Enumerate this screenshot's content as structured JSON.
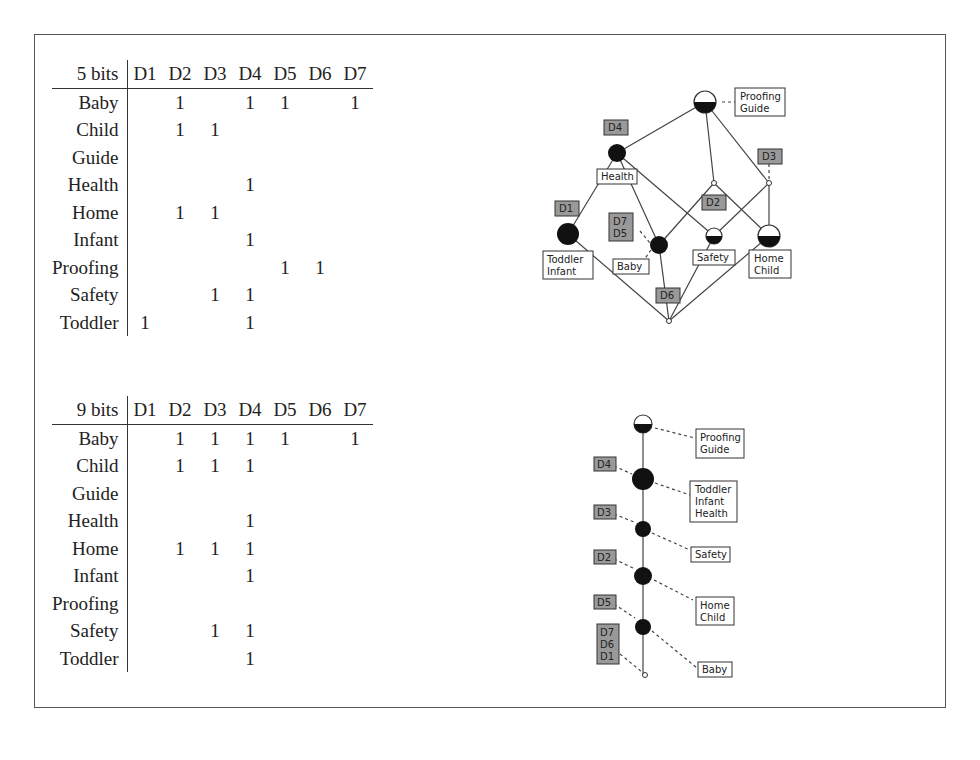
{
  "figure": {
    "tables": [
      {
        "title": "5 bits",
        "columns": [
          "D1",
          "D2",
          "D3",
          "D4",
          "D5",
          "D6",
          "D7"
        ],
        "rows": [
          {
            "label": "Baby",
            "cells": [
              "",
              "1",
              "",
              "1",
              "1",
              "",
              "1"
            ]
          },
          {
            "label": "Child",
            "cells": [
              "",
              "1",
              "1",
              "",
              "",
              "",
              ""
            ]
          },
          {
            "label": "Guide",
            "cells": [
              "",
              "",
              "",
              "",
              "",
              "",
              ""
            ]
          },
          {
            "label": "Health",
            "cells": [
              "",
              "",
              "",
              "1",
              "",
              "",
              ""
            ]
          },
          {
            "label": "Home",
            "cells": [
              "",
              "1",
              "1",
              "",
              "",
              "",
              ""
            ]
          },
          {
            "label": "Infant",
            "cells": [
              "",
              "",
              "",
              "1",
              "",
              "",
              ""
            ]
          },
          {
            "label": "Proofing",
            "cells": [
              "",
              "",
              "",
              "",
              "1",
              "1",
              ""
            ]
          },
          {
            "label": "Safety",
            "cells": [
              "",
              "",
              "1",
              "1",
              "",
              "",
              ""
            ]
          },
          {
            "label": "Toddler",
            "cells": [
              "1",
              "",
              "",
              "1",
              "",
              "",
              ""
            ]
          }
        ]
      },
      {
        "title": "9 bits",
        "columns": [
          "D1",
          "D2",
          "D3",
          "D4",
          "D5",
          "D6",
          "D7"
        ],
        "rows": [
          {
            "label": "Baby",
            "cells": [
              "",
              "1",
              "1",
              "1",
              "1",
              "",
              "1"
            ]
          },
          {
            "label": "Child",
            "cells": [
              "",
              "1",
              "1",
              "1",
              "",
              "",
              ""
            ]
          },
          {
            "label": "Guide",
            "cells": [
              "",
              "",
              "",
              "",
              "",
              "",
              ""
            ]
          },
          {
            "label": "Health",
            "cells": [
              "",
              "",
              "",
              "1",
              "",
              "",
              ""
            ]
          },
          {
            "label": "Home",
            "cells": [
              "",
              "1",
              "1",
              "1",
              "",
              "",
              ""
            ]
          },
          {
            "label": "Infant",
            "cells": [
              "",
              "",
              "",
              "1",
              "",
              "",
              ""
            ]
          },
          {
            "label": "Proofing",
            "cells": [
              "",
              "",
              "",
              "",
              "",
              "",
              ""
            ]
          },
          {
            "label": "Safety",
            "cells": [
              "",
              "",
              "1",
              "1",
              "",
              "",
              ""
            ]
          },
          {
            "label": "Toddler",
            "cells": [
              "",
              "",
              "",
              "1",
              "",
              "",
              ""
            ]
          }
        ]
      }
    ],
    "lattice5": {
      "object_labels": {
        "top": [
          "Proofing",
          "Guide"
        ],
        "health": [
          "Health"
        ],
        "toddler": [
          "Toddler",
          "Infant"
        ],
        "baby": [
          "Baby"
        ],
        "safety": [
          "Safety"
        ],
        "home": [
          "Home",
          "Child"
        ]
      },
      "attribute_labels": {
        "d4": [
          "D4"
        ],
        "d3": [
          "D3"
        ],
        "d1": [
          "D1"
        ],
        "d2": [
          "D2"
        ],
        "d7d5": [
          "D7",
          "D5"
        ],
        "d6": [
          "D6"
        ]
      }
    },
    "lattice9": {
      "object_labels": {
        "top": [
          "Proofing",
          "Guide"
        ],
        "n1": [
          "Toddler",
          "Infant",
          "Health"
        ],
        "n2": [
          "Safety"
        ],
        "n3": [
          "Home",
          "Child"
        ],
        "n4": [
          "Baby"
        ]
      },
      "attribute_labels": {
        "n1": [
          "D4"
        ],
        "n2": [
          "D3"
        ],
        "n3": [
          "D2"
        ],
        "n4": [
          "D5"
        ],
        "bottom": [
          "D7",
          "D6",
          "D1"
        ]
      }
    }
  }
}
